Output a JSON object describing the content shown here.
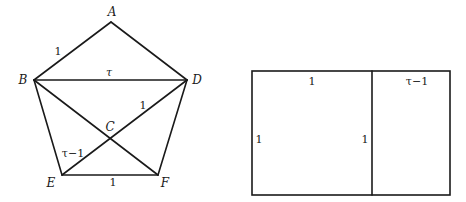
{
  "pentagon": {
    "vertices": [
      {
        "id": "A",
        "label": "A",
        "x": 111,
        "y": 22,
        "lx": 112,
        "ly": 16
      },
      {
        "id": "B",
        "label": "B",
        "x": 34,
        "y": 80,
        "lx": 23,
        "ly": 84
      },
      {
        "id": "D",
        "label": "D",
        "x": 187,
        "y": 80,
        "lx": 197,
        "ly": 84
      },
      {
        "id": "C",
        "label": "C",
        "x": 110,
        "y": 140,
        "lx": 110,
        "ly": 131
      },
      {
        "id": "E",
        "label": "E",
        "x": 62,
        "y": 175,
        "lx": 51,
        "ly": 187
      },
      {
        "id": "F",
        "label": "F",
        "x": 158,
        "y": 175,
        "lx": 165,
        "ly": 187
      }
    ],
    "edges": [
      [
        "A",
        "B"
      ],
      [
        "A",
        "D"
      ],
      [
        "B",
        "D"
      ],
      [
        "B",
        "E"
      ],
      [
        "D",
        "F"
      ],
      [
        "E",
        "F"
      ],
      [
        "B",
        "F"
      ],
      [
        "D",
        "E"
      ]
    ],
    "edge_labels": [
      {
        "text": "1",
        "x": 58,
        "y": 55,
        "italic": false
      },
      {
        "text": "τ",
        "x": 109,
        "y": 76,
        "italic": true
      },
      {
        "text": "1",
        "x": 143,
        "y": 109,
        "italic": false
      },
      {
        "text": "τ−1",
        "x": 73,
        "y": 157,
        "italic": false
      },
      {
        "text": "1",
        "x": 113,
        "y": 186,
        "italic": false
      }
    ]
  },
  "rectangle": {
    "x": 252,
    "y": 71,
    "width": 198,
    "height": 124,
    "divider_x": 372,
    "labels": [
      {
        "text": "1",
        "x": 312,
        "y": 85
      },
      {
        "text": "τ−1",
        "x": 417,
        "y": 85
      },
      {
        "text": "1",
        "x": 259,
        "y": 143
      },
      {
        "text": "1",
        "x": 365,
        "y": 143
      }
    ]
  }
}
